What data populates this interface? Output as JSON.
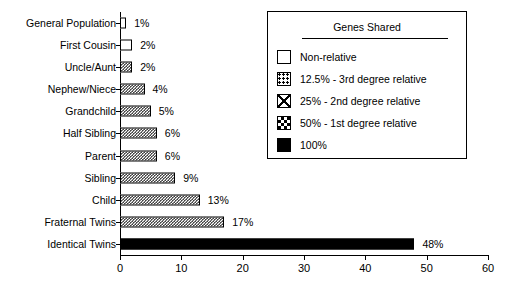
{
  "chart_data": {
    "type": "bar",
    "orientation": "horizontal",
    "title": "",
    "xlabel": "",
    "ylabel": "",
    "xlim": [
      0,
      60
    ],
    "xticks": [
      0,
      10,
      20,
      30,
      40,
      50,
      60
    ],
    "grid": false,
    "legend_position": "upper right",
    "categories": [
      "General Population",
      "First Cousin",
      "Uncle/Aunt",
      "Nephew/Niece",
      "Grandchild",
      "Half Sibling",
      "Parent",
      "Sibling",
      "Child",
      "Fraternal Twins",
      "Identical Twins"
    ],
    "values": [
      1,
      2,
      2,
      4,
      5,
      6,
      6,
      9,
      13,
      17,
      48
    ],
    "value_labels": [
      "1%",
      "2%",
      "2%",
      "4%",
      "5%",
      "6%",
      "6%",
      "9%",
      "13%",
      "17%",
      "48%"
    ],
    "bar_patterns": [
      "none",
      "none",
      "checker",
      "checker",
      "checker",
      "checker",
      "checker",
      "checker",
      "checker",
      "checker",
      "solid"
    ]
  },
  "legend": {
    "title": "Genes Shared",
    "entries": [
      {
        "pattern": "none",
        "label": "Non-relative"
      },
      {
        "pattern": "dots",
        "label": "12.5% - 3rd degree relative"
      },
      {
        "pattern": "cross",
        "label": "25% - 2nd degree relative"
      },
      {
        "pattern": "checker",
        "label": "50% - 1st degree relative"
      },
      {
        "pattern": "solid",
        "label": "100%"
      }
    ]
  },
  "colors": {
    "foreground": "#000000",
    "background": "#ffffff"
  }
}
